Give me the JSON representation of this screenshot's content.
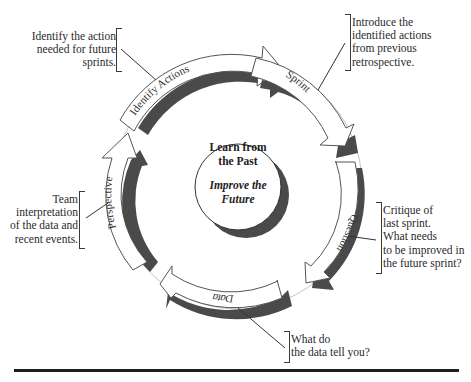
{
  "diagram": {
    "center": {
      "title": "Learn from\nthe Past",
      "subtitle": "Improve the\nFuture"
    },
    "stages": [
      {
        "id": "identify-actions",
        "label": "Identify Actions"
      },
      {
        "id": "sprint",
        "label": "Sprint"
      },
      {
        "id": "question",
        "label": "Question"
      },
      {
        "id": "data",
        "label": "Data"
      },
      {
        "id": "perspective",
        "label": "Perspective"
      }
    ],
    "callouts": {
      "identify_actions": "Identify the action\nneeded for future\nsprints.",
      "sprint": "Introduce the\nidentified actions\nfrom previous\nretrospective.",
      "question": "Critique of\nlast sprint.\nWhat needs\nto be improved in\nthe future sprint?",
      "data": "What do\nthe data tell you?",
      "perspective": "Team\ninterpretation\nof the data and\nrecent events."
    },
    "colors": {
      "arrow_fill": "#ffffff",
      "arrow_outline": "#555555",
      "shadow": "#4a4a4a",
      "guide_circle": "#bdbdbd",
      "text": "#2a2a2a"
    }
  }
}
